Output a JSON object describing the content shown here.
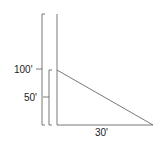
{
  "diagram": {
    "labels": {
      "total_height": "100'",
      "lower_height": "50'",
      "base_length": "30'"
    },
    "colors": {
      "line": "#555555",
      "text": "#222222",
      "background": "#ffffff"
    }
  }
}
